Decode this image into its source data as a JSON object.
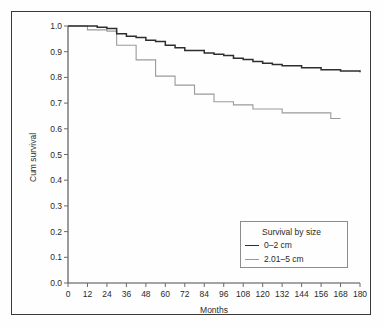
{
  "chart_data": {
    "type": "line",
    "subtype": "kaplan-meier-step",
    "title": "",
    "xlabel": "Months",
    "ylabel": "Cum survival",
    "xlim": [
      0,
      180
    ],
    "ylim": [
      0.0,
      1.0
    ],
    "xticks": [
      0,
      12,
      24,
      36,
      48,
      60,
      72,
      84,
      96,
      108,
      120,
      132,
      144,
      156,
      168,
      180
    ],
    "xtick_labels": [
      "0",
      "12",
      "24",
      "36",
      "48",
      "60",
      "72",
      "84",
      "96",
      "108",
      "120",
      "132",
      "144",
      "156",
      "168",
      "180"
    ],
    "yticks": [
      0.0,
      0.1,
      0.2,
      0.3,
      0.4,
      0.5,
      0.6,
      0.7,
      0.8,
      0.9,
      1.0
    ],
    "ytick_labels": [
      "0.0",
      "0.1",
      "0.2",
      "0.3",
      "0.4",
      "0.5",
      "0.6",
      "0.7",
      "0.8",
      "0.9",
      "1.0"
    ],
    "grid": false,
    "legend_position": "lower-right",
    "legend_title": "Survival by size",
    "series": [
      {
        "name": "0–2 cm",
        "color": "#2e2e2e",
        "x": [
          0,
          12,
          18,
          24,
          30,
          36,
          42,
          48,
          54,
          60,
          66,
          72,
          84,
          90,
          96,
          102,
          108,
          114,
          120,
          126,
          132,
          144,
          156,
          168,
          180
        ],
        "y": [
          1.0,
          1.0,
          0.995,
          0.99,
          0.97,
          0.96,
          0.955,
          0.945,
          0.94,
          0.925,
          0.915,
          0.905,
          0.895,
          0.89,
          0.885,
          0.875,
          0.87,
          0.862,
          0.855,
          0.85,
          0.845,
          0.838,
          0.83,
          0.825,
          0.82
        ]
      },
      {
        "name": "2.01–5 cm",
        "color": "#9a9a9a",
        "x": [
          0,
          10,
          12,
          22,
          24,
          28,
          30,
          36,
          42,
          48,
          54,
          60,
          66,
          72,
          78,
          84,
          90,
          96,
          102,
          108,
          114,
          120,
          132,
          144,
          156,
          162,
          168
        ],
        "y": [
          1.0,
          1.0,
          0.985,
          0.985,
          0.98,
          0.98,
          0.925,
          0.925,
          0.868,
          0.868,
          0.805,
          0.805,
          0.77,
          0.77,
          0.735,
          0.735,
          0.705,
          0.705,
          0.693,
          0.693,
          0.677,
          0.677,
          0.662,
          0.662,
          0.662,
          0.64,
          0.64
        ]
      }
    ]
  },
  "axes": {
    "x_title": "Months",
    "y_title": "Cum survival"
  },
  "legend": {
    "title": "Survival by size",
    "entries": [
      {
        "label": "0–2 cm",
        "color": "#2e2e2e"
      },
      {
        "label": "2.01–5 cm",
        "color": "#9a9a9a"
      }
    ]
  },
  "colors": {
    "series_small": "#2e2e2e",
    "series_large": "#9a9a9a",
    "frame": "#3a3a3a",
    "axis": "#4a4a4a",
    "background": "#fefefe"
  }
}
